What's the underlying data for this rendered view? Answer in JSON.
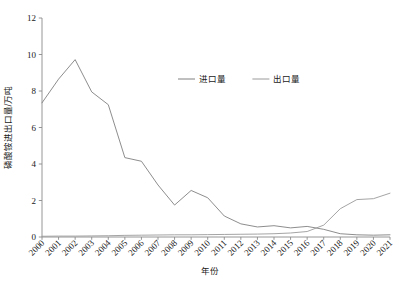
{
  "chart_data": {
    "type": "line",
    "title": "",
    "xlabel": "年份",
    "ylabel": "磷酸铵进出口量/万吨",
    "x": [
      "2000",
      "2001",
      "2002",
      "2003",
      "2004",
      "2005",
      "2006",
      "2007",
      "2008",
      "2009",
      "2010",
      "2011",
      "2012",
      "2013",
      "2014",
      "2015",
      "2016",
      "2017",
      "2018",
      "2019",
      "2020",
      "2021"
    ],
    "xlim": [
      2000,
      2021
    ],
    "ylim": [
      0,
      12
    ],
    "yticks": [
      0,
      2,
      4,
      6,
      8,
      10,
      12
    ],
    "ytick_labels": [
      "0",
      "2",
      "4",
      "6",
      "8",
      "10",
      "12"
    ],
    "grid": false,
    "legend_position": "top-center-right",
    "series": [
      {
        "name": "进口量",
        "color": "#808080",
        "values": [
          7.35,
          8.65,
          9.72,
          7.95,
          7.25,
          4.35,
          4.15,
          2.85,
          1.75,
          2.55,
          2.15,
          1.15,
          0.72,
          0.55,
          0.62,
          0.5,
          0.58,
          0.42,
          0.18,
          0.12,
          0.1,
          0.12
        ]
      },
      {
        "name": "出口量",
        "color": "#9a9a9a",
        "values": [
          0.04,
          0.05,
          0.05,
          0.06,
          0.07,
          0.09,
          0.1,
          0.11,
          0.12,
          0.12,
          0.13,
          0.14,
          0.15,
          0.16,
          0.18,
          0.22,
          0.3,
          0.65,
          1.55,
          2.05,
          2.1,
          2.4
        ]
      }
    ]
  },
  "legend": {
    "items": [
      {
        "label": "进口量"
      },
      {
        "label": "出口量"
      }
    ]
  },
  "axes": {
    "x_title": "年份",
    "y_title": "磷酸铵进出口量/万吨"
  }
}
